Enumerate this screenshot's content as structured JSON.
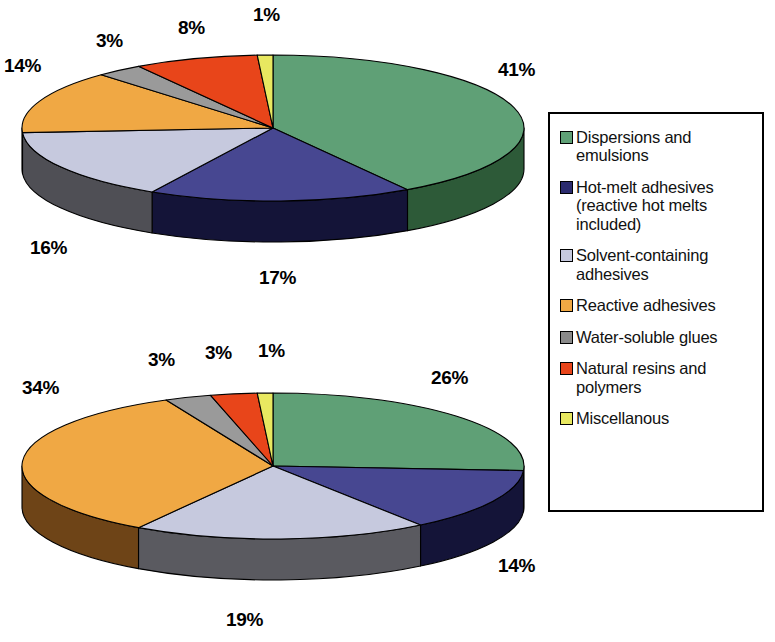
{
  "chart_data": [
    {
      "type": "pie",
      "title": "",
      "name": "adhesives-share-chart-top",
      "style": "3d-pie",
      "categories": [
        "Dispersions and emulsions",
        "Hot-melt adhesives (reactive hot melts included)",
        "Solvent-containing adhesives",
        "Reactive adhesives",
        "Water-soluble glues",
        "Natural resins and polymers",
        "Miscellanous"
      ],
      "values": [
        41,
        17,
        16,
        14,
        3,
        8,
        1
      ],
      "labels": [
        "41%",
        "17%",
        "16%",
        "14%",
        "3%",
        "8%",
        "1%"
      ],
      "unit": "%",
      "colors": [
        "#5FA076",
        "#474791",
        "#C6C9DE",
        "#F0A844",
        "#9A9A9A",
        "#E8451A",
        "#E8E860"
      ],
      "side_colors": [
        "#2D5A38",
        "#141438",
        "#4F4F55",
        "#B57A2A",
        "#5A5A5A",
        "#A8300F",
        "#A8A838"
      ],
      "legend_position": "right",
      "grid": false
    },
    {
      "type": "pie",
      "title": "",
      "name": "adhesives-share-chart-bottom",
      "style": "3d-pie",
      "categories": [
        "Dispersions and emulsions",
        "Hot-melt adhesives (reactive hot melts included)",
        "Solvent-containing adhesives",
        "Reactive adhesives",
        "Water-soluble glues",
        "Natural resins and polymers",
        "Miscellanous"
      ],
      "values": [
        26,
        14,
        19,
        34,
        3,
        3,
        1
      ],
      "labels": [
        "26%",
        "14%",
        "19%",
        "34%",
        "3%",
        "3%",
        "1%"
      ],
      "unit": "%",
      "colors": [
        "#5FA076",
        "#474791",
        "#C6C9DE",
        "#F0A844",
        "#9A9A9A",
        "#E8451A",
        "#E8E860"
      ],
      "side_colors": [
        "#2D5A38",
        "#141438",
        "#5A5A60",
        "#6E4417",
        "#5A5A5A",
        "#A8300F",
        "#A8A838"
      ],
      "legend_position": "right",
      "grid": false
    }
  ],
  "legend": {
    "items": [
      {
        "label": "Dispersions and emulsions",
        "color": "#5FA076",
        "swatch_name": "legend-swatch-dispersions"
      },
      {
        "label": "Hot-melt adhesives (reactive hot melts included)",
        "color": "#2B2B6E",
        "swatch_name": "legend-swatch-hot-melt"
      },
      {
        "label": "Solvent-containing adhesives",
        "color": "#C6C9DE",
        "swatch_name": "legend-swatch-solvent"
      },
      {
        "label": "Reactive adhesives",
        "color": "#F0A844",
        "swatch_name": "legend-swatch-reactive"
      },
      {
        "label": "Water-soluble glues",
        "color": "#8A8A8A",
        "swatch_name": "legend-swatch-water-soluble"
      },
      {
        "label": "Natural resins and polymers",
        "color": "#E8451A",
        "swatch_name": "legend-swatch-natural-resins"
      },
      {
        "label": "Miscellanous",
        "color": "#E8E860",
        "swatch_name": "legend-swatch-miscellanous"
      }
    ]
  },
  "pie_top_labels": [
    {
      "text": "41%",
      "x": 498,
      "y": 60
    },
    {
      "text": "17%",
      "x": 259,
      "y": 268
    },
    {
      "text": "16%",
      "x": 30,
      "y": 238
    },
    {
      "text": "14%",
      "x": 4,
      "y": 56
    },
    {
      "text": "3%",
      "x": 96,
      "y": 31
    },
    {
      "text": "8%",
      "x": 178,
      "y": 18
    },
    {
      "text": "1%",
      "x": 253,
      "y": 5
    }
  ],
  "pie_bottom_labels": [
    {
      "text": "26%",
      "x": 431,
      "y": 368
    },
    {
      "text": "14%",
      "x": 498,
      "y": 556
    },
    {
      "text": "19%",
      "x": 226,
      "y": 610
    },
    {
      "text": "34%",
      "x": 22,
      "y": 378
    },
    {
      "text": "3%",
      "x": 148,
      "y": 350
    },
    {
      "text": "3%",
      "x": 205,
      "y": 343
    },
    {
      "text": "1%",
      "x": 258,
      "y": 341
    }
  ],
  "pie_geometry": {
    "top": {
      "cx": 273,
      "cy": 128,
      "rx": 251,
      "ry": 73,
      "depth": 41,
      "start_angle": -90
    },
    "bottom": {
      "cx": 273,
      "cy": 466,
      "rx": 251,
      "ry": 73,
      "depth": 41,
      "start_angle": -90
    }
  }
}
